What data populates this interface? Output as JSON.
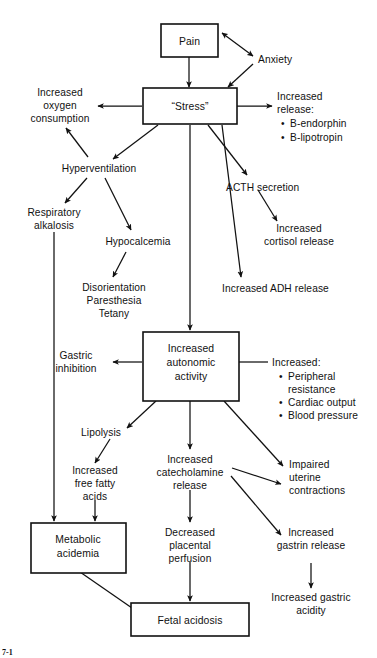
{
  "figure": {
    "caption_partial": "7-1",
    "domain": "Diagram",
    "background_color": "#ffffff",
    "ink_color": "#111111"
  },
  "nodes": {
    "pain": {
      "label": "Pain",
      "shape": "box"
    },
    "anxiety": {
      "label": "Anxiety",
      "shape": "text"
    },
    "stress": {
      "label": "“Stress”",
      "shape": "box"
    },
    "increased_oxygen": {
      "line1": "Increased",
      "line2": "oxygen",
      "line3": "consumption",
      "shape": "text"
    },
    "increased_release": {
      "title": "Increased",
      "title2": "release:",
      "bullets": [
        "B-endorphin",
        "B-lipotropin"
      ],
      "shape": "text-list"
    },
    "hyperventilation": {
      "label": "Hyperventilation",
      "shape": "text"
    },
    "acth_secretion": {
      "label": "ACTH secretion",
      "shape": "text"
    },
    "respiratory_alkalosis": {
      "line1": "Respiratory",
      "line2": "alkalosis",
      "shape": "text"
    },
    "hypocalcemia": {
      "label": "Hypocalcemia",
      "shape": "text"
    },
    "increased_cortisol": {
      "line1": "Increased",
      "line2": "cortisol release",
      "shape": "text"
    },
    "disorientation_group": {
      "line1": "Disorientation",
      "line2": "Paresthesia",
      "line3": "Tetany",
      "shape": "text"
    },
    "increased_adh": {
      "label": "Increased ADH release",
      "shape": "text"
    },
    "increased_autonomic": {
      "line1": "Increased",
      "line2": "autonomic",
      "line3": "activity",
      "shape": "box"
    },
    "gastric_inhibition": {
      "line1": "Gastric",
      "line2": "inhibition",
      "shape": "text"
    },
    "increased_cardio": {
      "title": "Increased:",
      "bullets": [
        "Peripheral",
        "resistance",
        "Cardiac output",
        "Blood pressure"
      ],
      "bullet_lines": [
        {
          "text": "Peripheral",
          "has_bullet": true
        },
        {
          "text": "resistance",
          "has_bullet": false
        },
        {
          "text": "Cardiac output",
          "has_bullet": true
        },
        {
          "text": "Blood pressure",
          "has_bullet": true
        }
      ],
      "shape": "text-list"
    },
    "lipolysis": {
      "label": "Lipolysis",
      "shape": "text"
    },
    "increased_catecholamine": {
      "line1": "Increased",
      "line2": "catecholamine",
      "line3": "release",
      "shape": "text"
    },
    "impaired_uterine": {
      "line1": "Impaired",
      "line2": "uterine",
      "line3": "contractions",
      "shape": "text"
    },
    "increased_ffa": {
      "line1": "Increased",
      "line2": "free fatty",
      "line3": "acids",
      "shape": "text"
    },
    "decreased_placental": {
      "line1": "Decreased",
      "line2": "placental",
      "line3": "perfusion",
      "shape": "text"
    },
    "increased_gastrin": {
      "line1": "Increased",
      "line2": "gastrin release",
      "shape": "text"
    },
    "metabolic_acidemia": {
      "line1": "Metabolic",
      "line2": "acidemia",
      "shape": "box"
    },
    "increased_gastric_acidity": {
      "line1": "Increased gastric",
      "line2": "acidity",
      "shape": "text"
    },
    "fetal_acidosis": {
      "label": "Fetal acidosis",
      "shape": "box"
    }
  },
  "edges": [
    {
      "from": "pain",
      "to": "stress",
      "arrow": "single"
    },
    {
      "from": "pain",
      "to": "anxiety",
      "arrow": "double"
    },
    {
      "from": "anxiety",
      "to": "stress",
      "arrow": "single"
    },
    {
      "from": "stress",
      "to": "increased_oxygen",
      "arrow": "single"
    },
    {
      "from": "stress",
      "to": "increased_release",
      "arrow": "single"
    },
    {
      "from": "stress",
      "to": "hyperventilation",
      "arrow": "single"
    },
    {
      "from": "stress",
      "to": "acth_secretion",
      "arrow": "single"
    },
    {
      "from": "stress",
      "to": "increased_adh",
      "arrow": "single"
    },
    {
      "from": "stress",
      "to": "increased_autonomic",
      "arrow": "single"
    },
    {
      "from": "hyperventilation",
      "to": "increased_oxygen",
      "arrow": "single"
    },
    {
      "from": "hyperventilation",
      "to": "respiratory_alkalosis",
      "arrow": "single"
    },
    {
      "from": "hyperventilation",
      "to": "hypocalcemia",
      "arrow": "single"
    },
    {
      "from": "acth_secretion",
      "to": "increased_cortisol",
      "arrow": "single"
    },
    {
      "from": "hypocalcemia",
      "to": "disorientation_group",
      "arrow": "single"
    },
    {
      "from": "respiratory_alkalosis",
      "to": "metabolic_acidemia",
      "arrow": "single"
    },
    {
      "from": "increased_autonomic",
      "to": "gastric_inhibition",
      "arrow": "single"
    },
    {
      "from": "increased_cardio",
      "to": "increased_autonomic",
      "arrow": "none"
    },
    {
      "from": "increased_autonomic",
      "to": "lipolysis",
      "arrow": "single"
    },
    {
      "from": "increased_autonomic",
      "to": "increased_catecholamine",
      "arrow": "single"
    },
    {
      "from": "increased_autonomic",
      "to": "impaired_uterine",
      "arrow": "single"
    },
    {
      "from": "lipolysis",
      "to": "increased_ffa",
      "arrow": "single"
    },
    {
      "from": "increased_catecholamine",
      "to": "decreased_placental",
      "arrow": "single"
    },
    {
      "from": "increased_catecholamine",
      "to": "impaired_uterine",
      "arrow": "single"
    },
    {
      "from": "increased_catecholamine",
      "to": "increased_gastrin",
      "arrow": "single"
    },
    {
      "from": "increased_ffa",
      "to": "metabolic_acidemia",
      "arrow": "single"
    },
    {
      "from": "increased_gastrin",
      "to": "increased_gastric_acidity",
      "arrow": "single"
    },
    {
      "from": "decreased_placental",
      "to": "fetal_acidosis",
      "arrow": "single"
    },
    {
      "from": "metabolic_acidemia",
      "to": "fetal_acidosis",
      "arrow": "none"
    }
  ]
}
